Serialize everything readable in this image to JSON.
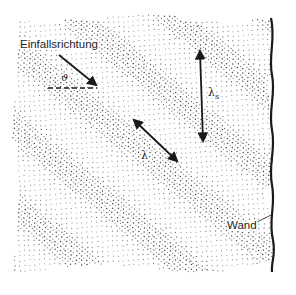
{
  "diagram": {
    "type": "wave-field-near-wall",
    "background": "#ffffff",
    "ink_color": "#1a1a1a",
    "dot_color": "#3a3a3a",
    "labels": {
      "incidence_direction": "Einfallsrichtung",
      "angle": "ϑ",
      "wavelength": "λ",
      "wall_wavelength_main": "λ",
      "wall_wavelength_sub": "s",
      "wall": "Wand"
    },
    "elements": {
      "incidence_arrow": {
        "from": [
          59,
          55
        ],
        "to": [
          97,
          86
        ]
      },
      "angle_reference_dashed_line": {
        "from": [
          48,
          88
        ],
        "to": [
          97,
          88
        ]
      },
      "wavelength_arrow": {
        "from": [
          133,
          119
        ],
        "to": [
          178,
          162
        ],
        "double_headed": true
      },
      "wall_wavelength_arrow": {
        "from": [
          200,
          50
        ],
        "to": [
          203,
          142
        ],
        "double_headed": true
      },
      "wall_line": {
        "x": 273,
        "y_top": 18,
        "y_bottom": 272,
        "wavy": true
      },
      "wall_leader_line": {
        "from": [
          257,
          222
        ],
        "to": [
          273,
          214
        ]
      }
    }
  }
}
